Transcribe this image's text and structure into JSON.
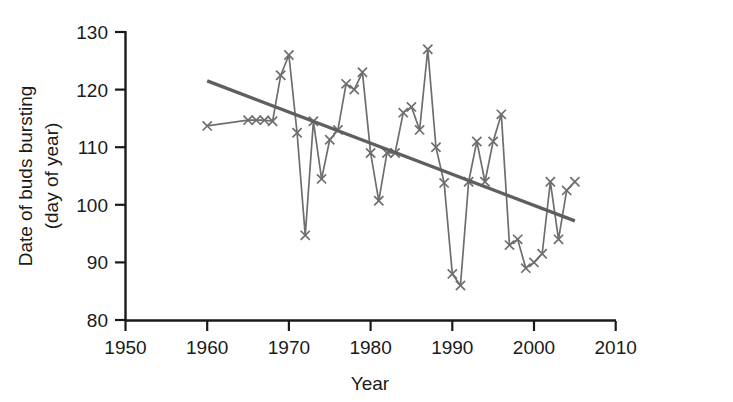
{
  "chart_data": {
    "type": "line",
    "title": "",
    "xlabel": "Year",
    "ylabel": "Date of buds bursting\n(day of year)",
    "ylabel_line1": "Date of buds bursting",
    "ylabel_line2": "(day of year)",
    "xlim": [
      1950,
      2010
    ],
    "ylim": [
      80,
      130
    ],
    "xticks": [
      1950,
      1960,
      1970,
      1980,
      1990,
      2000,
      2010
    ],
    "yticks": [
      80,
      90,
      100,
      110,
      120,
      130
    ],
    "grid": false,
    "legend": "none",
    "marker": "x",
    "series_color": "#6e6e6e",
    "trend_color": "#5f5f5f",
    "axis_color": "#1a1a1a",
    "series": [
      {
        "name": "Date of buds bursting",
        "x": [
          1960,
          1965,
          1966,
          1967,
          1968,
          1969,
          1970,
          1971,
          1972,
          1973,
          1974,
          1975,
          1976,
          1977,
          1978,
          1979,
          1980,
          1981,
          1982,
          1983,
          1984,
          1985,
          1986,
          1987,
          1988,
          1989,
          1990,
          1991,
          1992,
          1993,
          1994,
          1995,
          1996,
          1997,
          1998,
          1999,
          2000,
          2001,
          2002,
          2003,
          2004,
          2005
        ],
        "values": [
          113.7,
          114.7,
          114.7,
          114.7,
          114.5,
          122.5,
          126.0,
          112.5,
          94.7,
          114.5,
          104.5,
          111.3,
          113.0,
          121.0,
          120.0,
          123.0,
          109.0,
          100.7,
          109.0,
          109.0,
          116.0,
          117.0,
          113.0,
          127.0,
          110.0,
          103.8,
          88.0,
          86.0,
          104.0,
          111.0,
          104.0,
          111.0,
          115.7,
          93.0,
          94.0,
          89.0,
          90.0,
          91.5,
          104.0,
          94.0,
          102.5,
          104.0
        ]
      }
    ],
    "trend": {
      "name": "linear trend",
      "x": [
        1960,
        2005
      ],
      "values": [
        121.5,
        97.2
      ]
    }
  },
  "axes": {
    "y_tick_labels": [
      "130",
      "120",
      "110",
      "100",
      "90",
      "80"
    ],
    "x_tick_labels": [
      "1950",
      "1960",
      "1970",
      "1980",
      "1990",
      "2000",
      "2010"
    ],
    "x_axis_title": "Year",
    "y_axis_title_line1": "Date of buds bursting",
    "y_axis_title_line2": "(day of year)"
  }
}
